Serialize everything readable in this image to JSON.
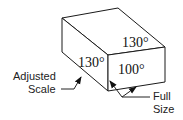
{
  "figure": {
    "faces": {
      "top": {
        "angle_label": "130°"
      },
      "left": {
        "angle_label": "130°"
      },
      "front": {
        "angle_label": "100°"
      }
    },
    "callouts": [
      {
        "line1": "Adjusted",
        "line2": "Scale"
      },
      {
        "line1": "Full",
        "line2": "Size"
      }
    ]
  }
}
